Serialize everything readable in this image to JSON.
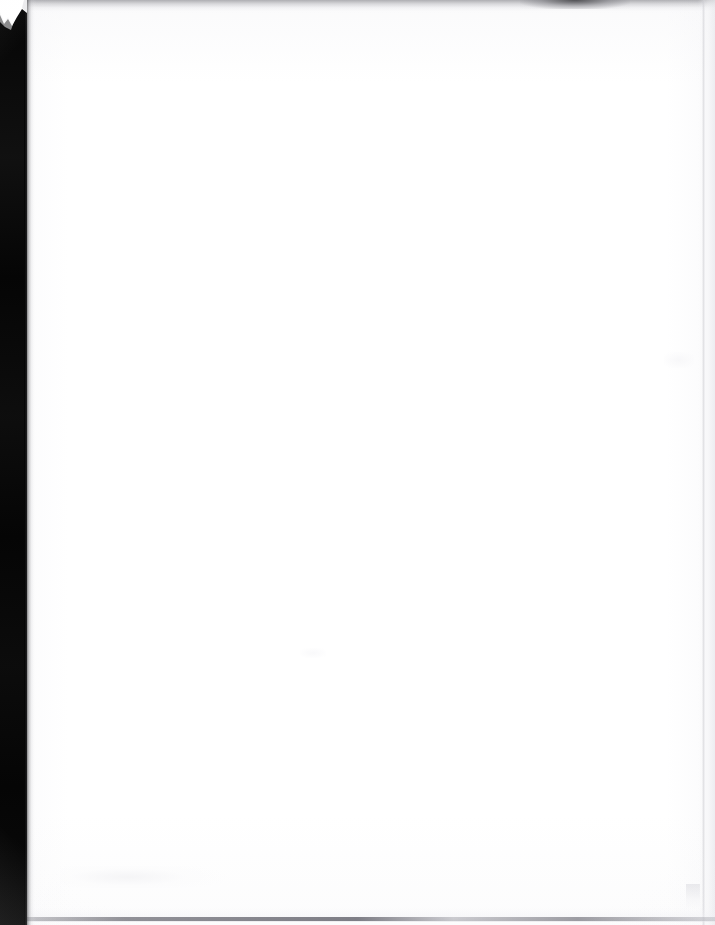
{
  "document": {
    "kind": "scanned-page",
    "page_content": "",
    "page_content_note": "blank page",
    "width_px": 715,
    "height_px": 925
  },
  "colors": {
    "paper": "#ffffff",
    "scanner_bed": "#050505",
    "edge_shadow": "#a8a8ac",
    "rule_gray": "#6a6a72",
    "page_tone": "#fbfbfc"
  },
  "artifacts": {
    "left_band": {
      "name": "scanner-bed-band",
      "width_px": 27,
      "color": "#050505"
    },
    "top_shadow": {
      "name": "top-edge-shadow",
      "height_px": 14
    },
    "corner_notch": {
      "name": "top-left-notch",
      "description": "jagged white wedge"
    },
    "right_rule": {
      "name": "right-edge-rule",
      "x_px": 702
    },
    "bottom_rule": {
      "name": "bottom-edge-rule",
      "y_px": 917
    }
  }
}
